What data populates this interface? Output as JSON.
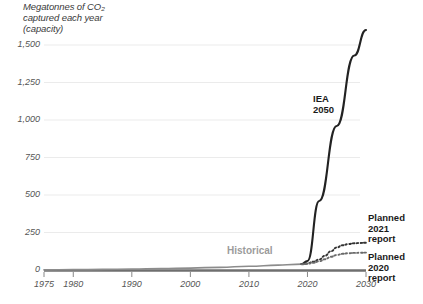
{
  "chart_data": {
    "type": "line",
    "title_line1": "Megatonnes of CO₂",
    "title_line2": "captured each year",
    "title_line3": "(capacity)",
    "xlabel": "",
    "ylabel": "Megatonnes of CO2 captured each year (capacity)",
    "xlim": [
      1975,
      2030
    ],
    "ylim": [
      0,
      1600
    ],
    "grid": true,
    "grid_axis": "y",
    "legend_position": "inline-annotations",
    "yticks": [
      0,
      250,
      500,
      750,
      1000,
      1250,
      1500
    ],
    "ytick_labels": [
      "0",
      "250",
      "500",
      "750",
      "1,000",
      "1,250",
      "1,500"
    ],
    "xticks": [
      1975,
      1980,
      1990,
      2000,
      2010,
      2020,
      2030
    ],
    "xtick_labels": [
      "1975",
      "1980",
      "1990",
      "2000",
      "2010",
      "2020",
      "2030"
    ],
    "series": [
      {
        "name": "Historical",
        "style": "solid",
        "color": "#8c8c8c",
        "x": [
          1975,
          1980,
          1985,
          1990,
          1995,
          2000,
          2005,
          2010,
          2015,
          2018,
          2020
        ],
        "values": [
          1,
          2,
          4,
          6,
          9,
          13,
          18,
          25,
          32,
          38,
          40
        ]
      },
      {
        "name": "IEA 2050",
        "style": "solid",
        "color": "#222222",
        "x": [
          2019,
          2020,
          2022,
          2025,
          2028,
          2030
        ],
        "values": [
          40,
          60,
          460,
          960,
          1430,
          1600
        ]
      },
      {
        "name": "Planned 2021 report",
        "style": "dotted",
        "color": "#333333",
        "x": [
          2019,
          2020,
          2021,
          2022,
          2023,
          2024,
          2025,
          2026,
          2027,
          2028,
          2029,
          2030
        ],
        "values": [
          40,
          45,
          55,
          70,
          95,
          125,
          150,
          165,
          173,
          178,
          180,
          182
        ]
      },
      {
        "name": "Planned 2020 report",
        "style": "dotted",
        "color": "#6a6a6a",
        "x": [
          2019,
          2020,
          2021,
          2022,
          2023,
          2024,
          2025,
          2026,
          2027,
          2028,
          2029,
          2030
        ],
        "values": [
          38,
          42,
          48,
          58,
          72,
          88,
          100,
          108,
          112,
          114,
          115,
          116
        ]
      }
    ],
    "annotations": [
      {
        "name": "iea-2050-label",
        "text": "IEA\n2050",
        "muted": false
      },
      {
        "name": "planned-2021-label",
        "text": "Planned\n2021\nreport",
        "muted": false
      },
      {
        "name": "planned-2020-label",
        "text": "Planned\n2020\nreport",
        "muted": false
      },
      {
        "name": "historical-label",
        "text": "Historical",
        "muted": true
      }
    ],
    "colors": {
      "grid": "#ebebeb",
      "axis": "#6f6f6f",
      "historical": "#8c8c8c",
      "iea": "#222222",
      "planned2021": "#333333",
      "planned2020": "#6a6a6a",
      "text": "#555555",
      "annotation": "#1a1a1a",
      "annotation_muted": "#9b9b9b"
    }
  }
}
